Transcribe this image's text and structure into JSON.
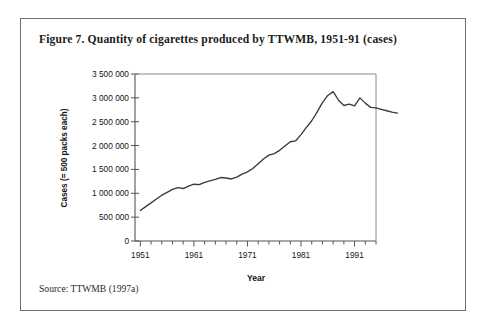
{
  "figure": {
    "title": "Figure 7. Quantity of cigarettes produced by TTWMB, 1951-91 (cases)",
    "source": "Source: TTWMB (1997a)"
  },
  "chart_data": {
    "type": "line",
    "title": "Figure 7. Quantity of cigarettes produced by TTWMB, 1951-91 (cases)",
    "xlabel": "Year",
    "ylabel": "Cases (= 500 packs each)",
    "xlim": [
      1950,
      1995
    ],
    "ylim": [
      0,
      3500000
    ],
    "grid": false,
    "legend": null,
    "ytick_labels": [
      "3 500 000",
      "3 000 000",
      "2 500 000",
      "2 000 000",
      "1 500 000",
      "1 000 000",
      "500 000",
      "0"
    ],
    "ytick_values": [
      3500000,
      3000000,
      2500000,
      2000000,
      1500000,
      1000000,
      500000,
      0
    ],
    "xtick_labels": [
      "1951",
      "1961",
      "1971",
      "1981",
      "1991"
    ],
    "xtick_values": [
      1951,
      1961,
      1971,
      1981,
      1991
    ],
    "x_minor_tick_step": 2,
    "x": [
      1951,
      1952,
      1953,
      1954,
      1955,
      1956,
      1957,
      1958,
      1959,
      1960,
      1961,
      1962,
      1963,
      1964,
      1965,
      1966,
      1967,
      1968,
      1969,
      1970,
      1971,
      1972,
      1973,
      1974,
      1975,
      1976,
      1977,
      1978,
      1979,
      1980,
      1981,
      1982,
      1983,
      1984,
      1985,
      1986,
      1987,
      1988,
      1989,
      1990,
      1991,
      1992,
      1993,
      1994
    ],
    "values": [
      640000,
      720000,
      800000,
      880000,
      960000,
      1020000,
      1080000,
      1120000,
      1100000,
      1150000,
      1190000,
      1180000,
      1230000,
      1260000,
      1290000,
      1330000,
      1320000,
      1300000,
      1340000,
      1400000,
      1450000,
      1520000,
      1620000,
      1720000,
      1800000,
      1830000,
      1900000,
      1990000,
      2080000,
      2100000,
      2230000,
      2380000,
      2520000,
      2700000,
      2900000,
      3050000,
      3130000,
      2950000,
      2840000,
      2870000,
      2830000,
      3000000,
      2890000,
      2800000
    ],
    "tail_values": [
      2790000,
      2760000,
      2730000,
      2700000,
      2680000
    ],
    "series_color": "#3a3a3a",
    "axis_color": "#555555",
    "peak": {
      "year": 1987,
      "value": 3130000
    },
    "start": {
      "year": 1951,
      "value": 640000
    },
    "end": {
      "year": 1996,
      "value": 2680000
    }
  },
  "axes": {
    "y_title": "Cases (= 500 packs each)",
    "x_title": "Year"
  }
}
